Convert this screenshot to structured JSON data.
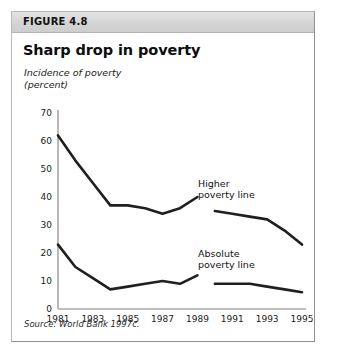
{
  "figure": {
    "label": "FIGURE 4.8",
    "title": "Sharp drop in poverty",
    "axis_caption_line1": "Incidence of poverty",
    "axis_caption_line2": "(percent)",
    "source": "Source: World Bank 1997c."
  },
  "annotations": {
    "higher_line1": "Higher",
    "higher_line2": "poverty line",
    "absolute_line1": "Absolute",
    "absolute_line2": "poverty line"
  },
  "colors": {
    "line": "#1f1f1f",
    "axis": "#a8a8a8",
    "header_band": "#d6d6d6",
    "border": "#b9b9b9"
  },
  "chart_data": {
    "type": "line",
    "title": "Sharp drop in poverty",
    "subtitle": "FIGURE 4.8",
    "xlabel": "",
    "ylabel": "Incidence of poverty (percent)",
    "xlim": [
      1981,
      1995
    ],
    "ylim": [
      0,
      70
    ],
    "yticks": [
      0,
      10,
      20,
      30,
      40,
      50,
      60,
      70
    ],
    "xticks": [
      1981,
      1983,
      1985,
      1987,
      1989,
      1991,
      1993,
      1995
    ],
    "grid": false,
    "legend": "inline-annotation",
    "source": "Source: World Bank 1997c.",
    "series": [
      {
        "name": "Higher poverty line",
        "x": [
          1981,
          1982,
          1983,
          1984,
          1985,
          1986,
          1987,
          1988,
          1989
        ],
        "values": [
          62,
          53,
          45,
          37,
          37,
          36,
          34,
          36,
          40
        ]
      },
      {
        "name": "Higher poverty line",
        "segment": 2,
        "x": [
          1990,
          1991,
          1992,
          1993,
          1994,
          1995
        ],
        "values": [
          35,
          34,
          33,
          32,
          28,
          23
        ]
      },
      {
        "name": "Absolute poverty line",
        "x": [
          1981,
          1982,
          1983,
          1984,
          1985,
          1986,
          1987,
          1988,
          1989
        ],
        "values": [
          23,
          15,
          11,
          7,
          8,
          9,
          10,
          9,
          12
        ]
      },
      {
        "name": "Absolute poverty line",
        "segment": 2,
        "x": [
          1990,
          1991,
          1992,
          1993,
          1994,
          1995
        ],
        "values": [
          9,
          9,
          9,
          8,
          7,
          6
        ]
      }
    ]
  }
}
